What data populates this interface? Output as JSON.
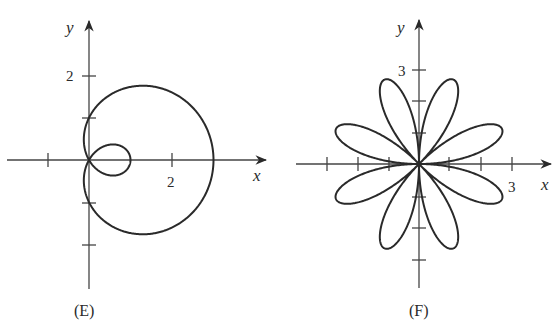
{
  "chart_data": [
    {
      "type": "line",
      "subtype": "polar-curve",
      "title": "(E)",
      "equation_shape": "limaçon with inner loop (r = 1 + 2cosθ)",
      "xlabel": "x",
      "ylabel": "y",
      "x_tick_labels": [
        "2"
      ],
      "y_tick_labels": [
        "2"
      ],
      "x_ticks": [
        -1,
        1,
        2
      ],
      "y_ticks": [
        -2,
        -1,
        1,
        2
      ],
      "xlim": [
        -2,
        4
      ],
      "ylim": [
        -3,
        3
      ],
      "grid": false,
      "key_points": {
        "outer_loop_right_x": 3,
        "inner_loop_right_x": 1,
        "y_intercepts": [
          1,
          -1
        ]
      }
    },
    {
      "type": "line",
      "subtype": "polar-curve",
      "title": "(F)",
      "equation_shape": "8-petal rose (r = 3 sin 4θ)",
      "xlabel": "x",
      "ylabel": "y",
      "x_tick_labels": [
        "3"
      ],
      "y_tick_labels": [
        "3"
      ],
      "x_ticks": [
        -3,
        -2,
        -1,
        1,
        2,
        3
      ],
      "y_ticks": [
        -3,
        -2,
        -1,
        1,
        2,
        3
      ],
      "xlim": [
        -3.5,
        4
      ],
      "ylim": [
        -4,
        4
      ],
      "grid": false,
      "petals": 8,
      "petal_length": 3
    }
  ],
  "plots": {
    "e": {
      "caption": "(E)",
      "x_label": "x",
      "y_label": "y",
      "x_tick": "2",
      "y_tick": "2"
    },
    "f": {
      "caption": "(F)",
      "x_label": "x",
      "y_label": "y",
      "x_tick": "3",
      "y_tick": "3"
    }
  }
}
